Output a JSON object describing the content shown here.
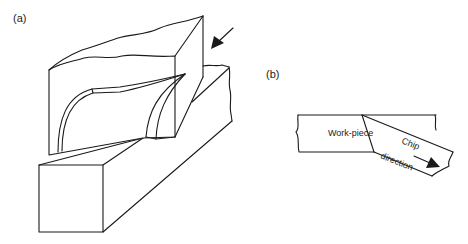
{
  "panels": [
    {
      "id": "a",
      "label": "(a)",
      "description": "3D view of cutting tool and workpiece with chip curling"
    },
    {
      "id": "b",
      "label": "(b)",
      "description": "2D side view of orthogonal cutting",
      "workpiece_label": "Work-piece",
      "chip_label_line1": "Chip",
      "chip_label_line2": "direction"
    }
  ],
  "colors": {
    "line": "#1a1a1a",
    "background": "#ffffff"
  }
}
